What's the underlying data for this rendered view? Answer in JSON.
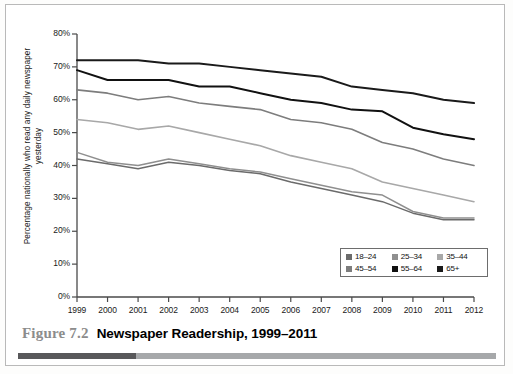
{
  "figure": {
    "number_label": "Figure 7.2",
    "title": "Newspaper Readership, 1999–2011",
    "rule_dark_color": "#58585a",
    "rule_light_color": "#a6a8aa"
  },
  "legend": {
    "position": "inside-bottom-right",
    "rows": [
      [
        {
          "label": "18–24",
          "color": "#6b6b6b"
        },
        {
          "label": "25–34",
          "color": "#8f8f8f"
        },
        {
          "label": "35–44",
          "color": "#a8a8a8"
        }
      ],
      [
        {
          "label": "45–54",
          "color": "#7d7d7d"
        },
        {
          "label": "55–64",
          "color": "#111111"
        },
        {
          "label": "65+",
          "color": "#1a1a1a"
        }
      ]
    ]
  },
  "chart_data": {
    "type": "line",
    "title": "Newspaper Readership, 1999–2011",
    "xlabel": "",
    "ylabel": "Percentage nationally who read any daily newspaper yesterday",
    "x": [
      1999,
      2000,
      2001,
      2002,
      2003,
      2004,
      2005,
      2006,
      2007,
      2008,
      2009,
      2010,
      2011,
      2012
    ],
    "xtick_labels": [
      "1999",
      "2000",
      "2001",
      "2002",
      "2003",
      "2004",
      "2005",
      "2006",
      "2007",
      "2008",
      "2009",
      "2010",
      "2011",
      "2012"
    ],
    "ytick_labels": [
      "0%",
      "10%",
      "20%",
      "30%",
      "40%",
      "50%",
      "60%",
      "70%",
      "80%"
    ],
    "ytick_values": [
      0,
      10,
      20,
      30,
      40,
      50,
      60,
      70,
      80
    ],
    "ylim": [
      0,
      80
    ],
    "xlim": [
      1999,
      2012
    ],
    "grid": false,
    "series": [
      {
        "name": "18–24",
        "color": "#6b6b6b",
        "width": 1.5,
        "values": [
          42,
          40.5,
          39,
          41,
          40,
          38.5,
          37.5,
          35,
          33,
          31,
          29,
          25.5,
          23.5,
          23.5
        ]
      },
      {
        "name": "25–34",
        "color": "#8f8f8f",
        "width": 1.5,
        "values": [
          44,
          41,
          40,
          42,
          40.5,
          39,
          38,
          36,
          34,
          32,
          31,
          26,
          24,
          24
        ]
      },
      {
        "name": "35–44",
        "color": "#a8a8a8",
        "width": 1.6,
        "values": [
          54,
          53,
          51,
          52,
          50,
          48,
          46,
          43,
          41,
          39,
          35,
          33,
          31,
          29
        ]
      },
      {
        "name": "45–54",
        "color": "#7d7d7d",
        "width": 1.6,
        "values": [
          63,
          62,
          60,
          61,
          59,
          58,
          57,
          54,
          53,
          51,
          47,
          45,
          42,
          40
        ]
      },
      {
        "name": "55–64",
        "color": "#111111",
        "width": 2.0,
        "values": [
          69,
          66,
          66,
          66,
          64,
          64,
          62,
          60,
          59,
          57,
          56.5,
          51.5,
          49.5,
          48
        ]
      },
      {
        "name": "65+",
        "color": "#1a1a1a",
        "width": 2.0,
        "values": [
          72,
          72,
          72,
          71,
          71,
          70,
          69,
          68,
          67,
          64,
          63,
          62,
          60,
          59
        ]
      }
    ]
  }
}
